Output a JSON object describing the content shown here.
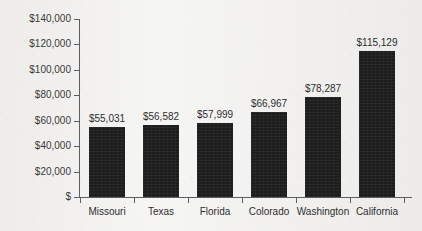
{
  "chart_data": {
    "type": "bar",
    "title": "",
    "xlabel": "",
    "ylabel": "",
    "categories": [
      "Missouri",
      "Texas",
      "Florida",
      "Colorado",
      "Washington",
      "California"
    ],
    "values": [
      55031,
      56582,
      57999,
      66967,
      78287,
      115129
    ],
    "value_labels": [
      "$55,031",
      "$56,582",
      "$57,999",
      "$66,967",
      "$78,287",
      "$115,129"
    ],
    "ylim": [
      0,
      140000
    ],
    "ytick_values": [
      0,
      20000,
      40000,
      60000,
      80000,
      100000,
      120000,
      140000
    ],
    "ytick_labels": [
      "$",
      "$20,000",
      "$40,000",
      "$60,000",
      "$80,000",
      "$100,000",
      "$120,000",
      "$140,000"
    ],
    "grid": false,
    "legend": false,
    "legend_position": "none",
    "bar_color": "#1d1d1d",
    "axis_color": "#5e5e5e",
    "text_color": "#2e2e2e",
    "background_color": "#f1f0ee"
  }
}
